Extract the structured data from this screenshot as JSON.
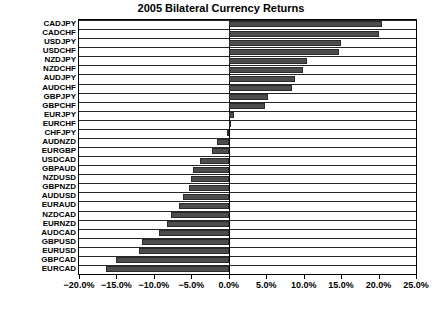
{
  "chart_data": {
    "type": "bar",
    "orientation": "horizontal",
    "title": "2005 Bilateral Currency Returns",
    "xlabel": "",
    "ylabel": "",
    "xlim": [
      -20.0,
      25.0
    ],
    "xticks": [
      -20.0,
      -15.0,
      -10.0,
      -5.0,
      0.0,
      5.0,
      10.0,
      15.0,
      20.0,
      25.0
    ],
    "xtick_labels": [
      "−20.0%",
      "−15.0%",
      "−10.0%",
      "−5.0%",
      "0.0%",
      "5.0%",
      "10.0%",
      "15.0%",
      "20.0%",
      "25.0%"
    ],
    "grid": true,
    "legend": false,
    "bar_color": "#4c4c4c",
    "categories": [
      "CADJPY",
      "CADCHF",
      "USDJPY",
      "USDCHF",
      "NZDJPY",
      "NZDCHF",
      "AUDJPY",
      "AUDCHF",
      "GBPJPY",
      "GBPCHF",
      "EURJPY",
      "EURCHF",
      "CHFJPY",
      "AUDNZD",
      "EURGBP",
      "USDCAD",
      "GBPAUD",
      "NZDUSD",
      "GBPNZD",
      "AUDUSD",
      "EURAUD",
      "NZDCAD",
      "EURNZD",
      "AUDCAD",
      "GBPUSD",
      "EURUSD",
      "GBPCAD",
      "EURCAD"
    ],
    "values": [
      20.5,
      20.0,
      15.0,
      14.7,
      10.4,
      9.9,
      8.8,
      8.4,
      5.2,
      4.8,
      0.7,
      0.3,
      -0.3,
      -1.6,
      -2.3,
      -3.9,
      -4.8,
      -5.0,
      -5.3,
      -6.1,
      -6.6,
      -7.7,
      -8.3,
      -9.3,
      -11.6,
      -12.0,
      -15.1,
      -16.4
    ]
  },
  "axis": {
    "x_zero_percent": 0.0
  }
}
